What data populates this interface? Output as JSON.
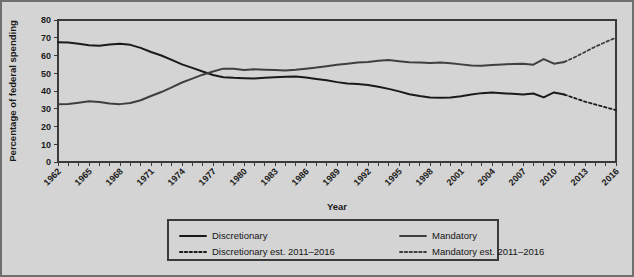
{
  "chart_data": {
    "type": "line",
    "title": "",
    "xlabel": "Year",
    "ylabel": "Percentage of federal spending",
    "xlim": [
      1962,
      2016
    ],
    "ylim": [
      0,
      80
    ],
    "ytick_step": 10,
    "yticks": [
      0,
      10,
      20,
      30,
      40,
      50,
      60,
      70,
      80
    ],
    "xticks": [
      1962,
      1965,
      1968,
      1971,
      1974,
      1977,
      1980,
      1983,
      1986,
      1989,
      1992,
      1995,
      1998,
      2001,
      2004,
      2007,
      2010,
      2013,
      2016
    ],
    "xtick_minor_every": 1,
    "grid": "horizontal",
    "legend_position": "bottom",
    "x": [
      1962,
      1963,
      1964,
      1965,
      1966,
      1967,
      1968,
      1969,
      1970,
      1971,
      1972,
      1973,
      1974,
      1975,
      1976,
      1977,
      1978,
      1979,
      1980,
      1981,
      1982,
      1983,
      1984,
      1985,
      1986,
      1987,
      1988,
      1989,
      1990,
      1991,
      1992,
      1993,
      1994,
      1995,
      1996,
      1997,
      1998,
      1999,
      2000,
      2001,
      2002,
      2003,
      2004,
      2005,
      2006,
      2007,
      2008,
      2009,
      2010,
      2011,
      2012,
      2013,
      2014,
      2015,
      2016
    ],
    "series": [
      {
        "name": "Discretionary",
        "style": "solid",
        "color": "#1a1a1a",
        "values": [
          67.5,
          67.3,
          66.6,
          65.8,
          65.5,
          66.2,
          66.6,
          66.0,
          64.3,
          62.0,
          60.0,
          57.5,
          55.0,
          53.0,
          51.0,
          49.0,
          47.8,
          47.4,
          47.2,
          47.0,
          47.4,
          47.8,
          48.0,
          48.2,
          47.6,
          46.8,
          46.0,
          45.0,
          44.2,
          44.0,
          43.4,
          42.4,
          41.2,
          39.8,
          38.2,
          37.2,
          36.4,
          36.2,
          36.4,
          37.0,
          38.0,
          38.8,
          39.2,
          38.8,
          38.4,
          38.0,
          38.6,
          36.4,
          39.2,
          38.0,
          null,
          null,
          null,
          null,
          null
        ]
      },
      {
        "name": "Mandatory",
        "style": "solid",
        "color": "#3f3f3f",
        "values": [
          32.5,
          32.7,
          33.4,
          34.2,
          33.8,
          33.0,
          32.6,
          33.2,
          34.8,
          37.2,
          39.4,
          42.0,
          44.8,
          47.0,
          49.2,
          51.0,
          52.6,
          52.6,
          51.8,
          52.2,
          52.0,
          51.8,
          51.6,
          52.0,
          52.6,
          53.2,
          54.0,
          54.8,
          55.4,
          56.0,
          56.4,
          57.0,
          57.4,
          56.8,
          56.2,
          56.0,
          55.8,
          56.0,
          55.6,
          55.0,
          54.4,
          54.2,
          54.6,
          55.0,
          55.2,
          55.4,
          54.8,
          58.0,
          55.4,
          56.4,
          null,
          null,
          null,
          null,
          null
        ]
      },
      {
        "name": "Discretionary est. 2011–2016",
        "style": "dashed",
        "color": "#1a1a1a",
        "values": [
          null,
          null,
          null,
          null,
          null,
          null,
          null,
          null,
          null,
          null,
          null,
          null,
          null,
          null,
          null,
          null,
          null,
          null,
          null,
          null,
          null,
          null,
          null,
          null,
          null,
          null,
          null,
          null,
          null,
          null,
          null,
          null,
          null,
          null,
          null,
          null,
          null,
          null,
          null,
          null,
          null,
          null,
          null,
          null,
          null,
          null,
          null,
          null,
          null,
          38.0,
          36.0,
          34.0,
          32.4,
          30.8,
          29.2
        ]
      },
      {
        "name": "Mandatory est. 2011–2016",
        "style": "dashed",
        "color": "#3f3f3f",
        "values": [
          null,
          null,
          null,
          null,
          null,
          null,
          null,
          null,
          null,
          null,
          null,
          null,
          null,
          null,
          null,
          null,
          null,
          null,
          null,
          null,
          null,
          null,
          null,
          null,
          null,
          null,
          null,
          null,
          null,
          null,
          null,
          null,
          null,
          null,
          null,
          null,
          null,
          null,
          null,
          null,
          null,
          null,
          null,
          null,
          null,
          null,
          null,
          null,
          null,
          56.4,
          59.0,
          62.0,
          65.0,
          67.6,
          70.0
        ]
      }
    ]
  },
  "legend": {
    "entries": [
      {
        "label": "Discretionary",
        "style": "solid"
      },
      {
        "label": "Mandatory",
        "style": "solid"
      },
      {
        "label": "Discretionary est. 2011–2016",
        "style": "dashed"
      },
      {
        "label": "Mandatory est. 2011–2016",
        "style": "dashed"
      }
    ]
  },
  "colors": {
    "figure_background": "#d4d4d4",
    "plot_background": "#d4d4d4",
    "gridline": "#555555",
    "frame": "#3a3a3a",
    "discretionary": "#1a1a1a",
    "mandatory": "#3f3f3f"
  }
}
